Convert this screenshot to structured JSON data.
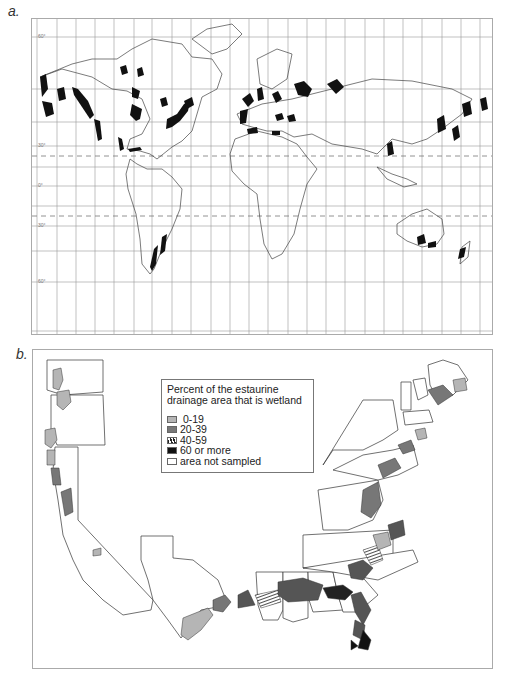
{
  "panel_a": {
    "label": "a.",
    "title": "World map of estuarine wetland coastlines",
    "latitude_labels": [
      "60°",
      "30°",
      "0°",
      "30°",
      "60°"
    ],
    "highlight_color": "#111111",
    "grid_color": "#888888"
  },
  "panel_b": {
    "label": "b.",
    "legend": {
      "title_line1": "Percent of the estaurine",
      "title_line2": "drainage area that is wetland",
      "items": [
        {
          "label": " 0-19",
          "color": "#b5b5b5",
          "pattern": "solid"
        },
        {
          "label": "20-39",
          "color": "#777777",
          "pattern": "solid"
        },
        {
          "label": "40-59",
          "color": "#333333",
          "pattern": "hatched"
        },
        {
          "label": "60 or more",
          "color": "#111111",
          "pattern": "solid"
        },
        {
          "label": "area not sampled",
          "color": "#ffffff",
          "pattern": "solid"
        }
      ]
    }
  }
}
